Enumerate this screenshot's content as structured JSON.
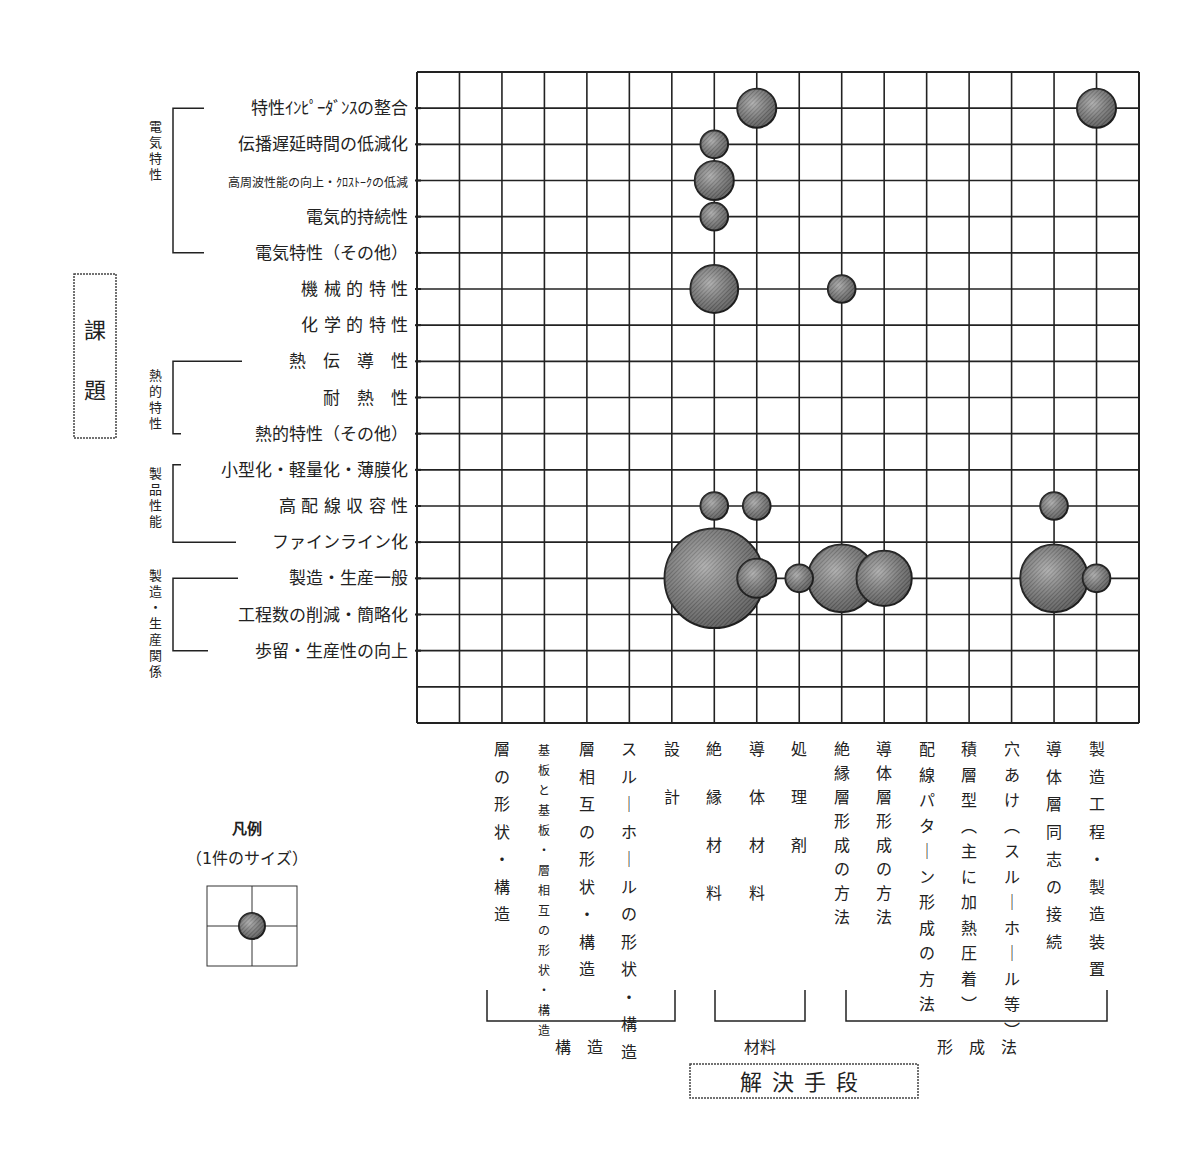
{
  "chart_data": {
    "type": "bubble-matrix",
    "title": "",
    "ylabel": "課題",
    "xlabel": "解決手段",
    "legend": {
      "title": "凡例",
      "subtitle": "（1件のサイズ）",
      "unit_count": 1
    },
    "y_groups": [
      {
        "label": "電気特性",
        "rows": [
          0,
          4
        ]
      },
      {
        "label": "熱的特性",
        "rows": [
          7,
          9
        ]
      },
      {
        "label": "製品性能",
        "rows": [
          10,
          12
        ]
      },
      {
        "label": "製造・生産関係",
        "rows": [
          13,
          15
        ]
      }
    ],
    "rows": [
      "特性ｲﾝﾋﾟｰﾀﾞﾝｽの整合",
      "伝播遅延時間の低減化",
      "高周波性能の向上・ｸﾛｽﾄｰｸの低減",
      "電気的持続性",
      "電気特性（その他）",
      "機 械 的 特 性",
      "化 学 的 特 性",
      "熱　伝　導　性",
      "耐　熱　性",
      "熱的特性（その他）",
      "小型化・軽量化・薄膜化",
      "高 配 線 収 容 性",
      "ファインライン化",
      "製造・生産一般",
      "工程数の削減・簡略化",
      "歩留・生産性の向上"
    ],
    "x_groups": [
      {
        "label": "構　造",
        "cols": [
          0,
          4
        ]
      },
      {
        "label": "材料",
        "cols": [
          5,
          7
        ]
      },
      {
        "label": "形　成　法",
        "cols": [
          8,
          14
        ]
      }
    ],
    "columns": [
      "層の形状・構造",
      "基板と基板・層相互の形状・構造",
      "層相互の形状・構造",
      "スルーホールの形状・構造",
      "設計",
      "絶縁材料",
      "導体材料",
      "処理剤",
      "絶縁層形成の方法",
      "導体層形成の方法",
      "配線パターン形成の方法",
      "積層型（主に加熱圧着）",
      "穴あけ（スルーホール等）",
      "導体層同志の接続",
      "製造工程・製造装置"
    ],
    "points": [
      {
        "row": 0,
        "col": 6,
        "count": 2
      },
      {
        "row": 0,
        "col": 14,
        "count": 2
      },
      {
        "row": 1,
        "col": 5,
        "count": 1
      },
      {
        "row": 2,
        "col": 5,
        "count": 2
      },
      {
        "row": 3,
        "col": 5,
        "count": 1
      },
      {
        "row": 5,
        "col": 5,
        "count": 3
      },
      {
        "row": 5,
        "col": 8,
        "count": 1
      },
      {
        "row": 11,
        "col": 5,
        "count": 1
      },
      {
        "row": 11,
        "col": 6,
        "count": 1
      },
      {
        "row": 11,
        "col": 13,
        "count": 1
      },
      {
        "row": 13,
        "col": 5,
        "count": 13
      },
      {
        "row": 13,
        "col": 6,
        "count": 2
      },
      {
        "row": 13,
        "col": 7,
        "count": 1
      },
      {
        "row": 13,
        "col": 8,
        "count": 6
      },
      {
        "row": 13,
        "col": 9,
        "count": 4
      },
      {
        "row": 13,
        "col": 13,
        "count": 6
      },
      {
        "row": 13,
        "col": 14,
        "count": 1
      }
    ],
    "grid": true
  },
  "colors": {
    "line": "#222222",
    "bubble": "#6e6e6e",
    "bubble_light": "#b4b4b4"
  }
}
